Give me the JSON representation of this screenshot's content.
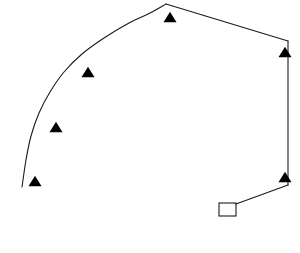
{
  "figure": {
    "title": "",
    "background_color": "#ffffff",
    "stroke_color": "#1a1a1a",
    "marker_fill_color": "#000000",
    "width": 300,
    "height": 253
  },
  "chart_data": {
    "type": "line",
    "title": "",
    "xlabel": "",
    "ylabel": "",
    "xlim": [
      0,
      300
    ],
    "ylim": [
      0,
      253
    ],
    "grid": false,
    "legend": null,
    "axes_visible": false,
    "series": [
      {
        "name": "arc-path",
        "kind": "curve",
        "closed": false,
        "points": [
          [
            22,
            187
          ],
          [
            26,
            160
          ],
          [
            31,
            136
          ],
          [
            39,
            113
          ],
          [
            50,
            92
          ],
          [
            64,
            72
          ],
          [
            82,
            54
          ],
          [
            104,
            38
          ],
          [
            129,
            23
          ],
          [
            150,
            13
          ],
          [
            166,
            4
          ]
        ]
      },
      {
        "name": "upper-right-segment",
        "kind": "line",
        "closed": false,
        "points": [
          [
            166,
            4
          ],
          [
            288,
            41
          ]
        ]
      },
      {
        "name": "right-vertical-segment",
        "kind": "line",
        "closed": false,
        "points": [
          [
            288,
            41
          ],
          [
            288,
            185
          ]
        ]
      },
      {
        "name": "lower-diagonal-segment",
        "kind": "line",
        "closed": false,
        "points": [
          [
            288,
            185
          ],
          [
            236,
            204
          ]
        ]
      }
    ],
    "markers": {
      "symbol": "triangle-up",
      "fill": "#000000",
      "size": 13,
      "points": [
        [
          35,
          181
        ],
        [
          56,
          127
        ],
        [
          88,
          72
        ],
        [
          170,
          17
        ],
        [
          285,
          52
        ],
        [
          285,
          177
        ]
      ],
      "count": 6
    },
    "annotations": [
      {
        "name": "open-square",
        "symbol": "square-open",
        "x": 219,
        "y": 203,
        "width": 17,
        "height": 13,
        "fill": "none",
        "stroke": "#1a1a1a"
      }
    ]
  }
}
